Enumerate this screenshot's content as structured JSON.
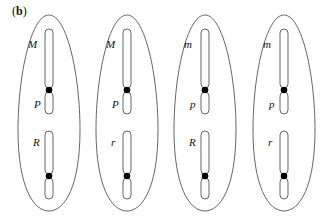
{
  "panel": {
    "open": "(",
    "letter": "b",
    "close": ")"
  },
  "colors": {
    "stroke": "#555555",
    "centromere": "#000000",
    "text": "#111111",
    "background": "#ffffff"
  },
  "cells": [
    {
      "cx": 49,
      "upper_label": "M",
      "middle_label": "P",
      "lower_label": "R"
    },
    {
      "cx": 127,
      "upper_label": "M",
      "middle_label": "P",
      "lower_label": "r"
    },
    {
      "cx": 205,
      "upper_label": "m",
      "middle_label": "p",
      "lower_label": "R"
    },
    {
      "cx": 284,
      "upper_label": "m",
      "middle_label": "p",
      "lower_label": "r"
    }
  ]
}
